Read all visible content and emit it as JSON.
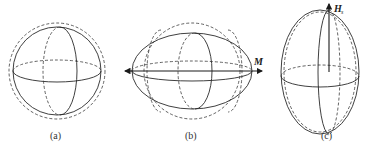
{
  "figure": {
    "panels": [
      {
        "id": "a",
        "label": "(a)",
        "description": "sphere: solid circle with dashed reference circle",
        "shape": "sphere"
      },
      {
        "id": "b",
        "label": "(b)",
        "description": "oblate/elongated horizontally along M",
        "shape": "horizontal-ellipsoid",
        "vector_label": "M"
      },
      {
        "id": "c",
        "label": "(c)",
        "description": "prolate/elongated vertically along H_s",
        "shape": "vertical-ellipsoid",
        "vector_label": "H",
        "vector_subscript": "s"
      }
    ],
    "colors": {
      "stroke": "#2a2a2a",
      "background": "#ffffff"
    }
  }
}
